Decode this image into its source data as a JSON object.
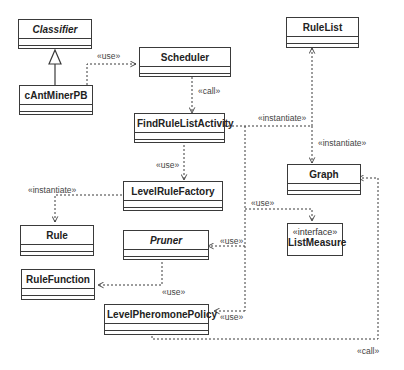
{
  "diagram": {
    "type": "UML class diagram",
    "classes": {
      "classifier": {
        "name": "Classifier",
        "abstract": true
      },
      "cantminerpb": {
        "name": "cAntMinerPB"
      },
      "scheduler": {
        "name": "Scheduler"
      },
      "rulelist": {
        "name": "RuleList"
      },
      "findrulelistactivity": {
        "name": "FindRuleListActivity"
      },
      "levelrulefactory": {
        "name": "LevelRuleFactory"
      },
      "graph": {
        "name": "Graph"
      },
      "rule": {
        "name": "Rule"
      },
      "pruner": {
        "name": "Pruner",
        "abstract": true
      },
      "listmeasure": {
        "name": "ListMeasure",
        "stereotype": "«interface»"
      },
      "rulefunction": {
        "name": "RuleFunction"
      },
      "levelpheromonepolicy": {
        "name": "LevelPheromonePolicy"
      }
    },
    "relations": [
      {
        "from": "cAntMinerPB",
        "to": "Classifier",
        "kind": "generalization",
        "label": ""
      },
      {
        "from": "cAntMinerPB",
        "to": "Scheduler",
        "kind": "dependency",
        "label": "«use»"
      },
      {
        "from": "Scheduler",
        "to": "FindRuleListActivity",
        "kind": "dependency",
        "label": "«call»"
      },
      {
        "from": "FindRuleListActivity",
        "to": "RuleList",
        "kind": "dependency",
        "label": "«instantiate»"
      },
      {
        "from": "FindRuleListActivity",
        "to": "Graph",
        "kind": "dependency",
        "label": "«instantiate»"
      },
      {
        "from": "FindRuleListActivity",
        "to": "LevelRuleFactory",
        "kind": "dependency",
        "label": "«use»"
      },
      {
        "from": "LevelRuleFactory",
        "to": "Rule",
        "kind": "dependency",
        "label": "«instantiate»"
      },
      {
        "from": "FindRuleListActivity",
        "to": "ListMeasure",
        "kind": "dependency",
        "label": "«use»"
      },
      {
        "from": "FindRuleListActivity",
        "to": "Pruner",
        "kind": "dependency",
        "label": "«use»"
      },
      {
        "from": "Pruner",
        "to": "RuleFunction",
        "kind": "dependency",
        "label": "«use»"
      },
      {
        "from": "FindRuleListActivity",
        "to": "LevelPheromonePolicy",
        "kind": "dependency",
        "label": "«use»"
      },
      {
        "from": "LevelPheromonePolicy",
        "to": "Graph",
        "kind": "dependency",
        "label": "«call»"
      }
    ],
    "labels": {
      "use_cant_sched": "«use»",
      "call_sched_find": "«call»",
      "inst_find_rulelist": "«instantiate»",
      "inst_find_graph": "«instantiate»",
      "use_find_factory": "«use»",
      "inst_factory_rule": "«instantiate»",
      "use_find_listmeasure": "«use»",
      "use_find_pruner": "«use»",
      "use_pruner_rulefunction": "«use»",
      "use_find_policy": "«use»",
      "call_policy_graph": "«call»"
    },
    "colors": {
      "line": "#3a3a3a",
      "background": "#ffffff"
    }
  }
}
